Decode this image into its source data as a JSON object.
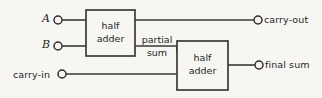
{
  "figure": {
    "background_color": "#f7f6f3",
    "line_color": "#3a3a3a"
  },
  "inputs": [
    {
      "id": "a",
      "label": "A",
      "terminal": "input-terminal",
      "x": 58,
      "y": 20
    },
    {
      "id": "b",
      "label": "B",
      "terminal": "input-terminal",
      "x": 58,
      "y": 46
    },
    {
      "id": "carry_in",
      "label": "carry-in",
      "terminal": "input-terminal",
      "x": 62,
      "y": 74
    }
  ],
  "outputs": [
    {
      "id": "carry_out",
      "label": "carry-out",
      "terminal": "output-terminal",
      "x": 258,
      "y": 20
    },
    {
      "id": "final_sum",
      "label": "final sum",
      "terminal": "output-terminal",
      "x": 259,
      "y": 65
    }
  ],
  "blocks": [
    {
      "id": "half_adder_1",
      "line1": "half",
      "line2": "adder",
      "x": 86,
      "y": 10,
      "width": 49,
      "height": 46
    },
    {
      "id": "half_adder_2",
      "line1": "half",
      "line2": "adder",
      "x": 177,
      "y": 41,
      "width": 51,
      "height": 49
    }
  ],
  "signals": [
    {
      "id": "partial_sum",
      "line1": "partial",
      "line2": "sum"
    }
  ]
}
